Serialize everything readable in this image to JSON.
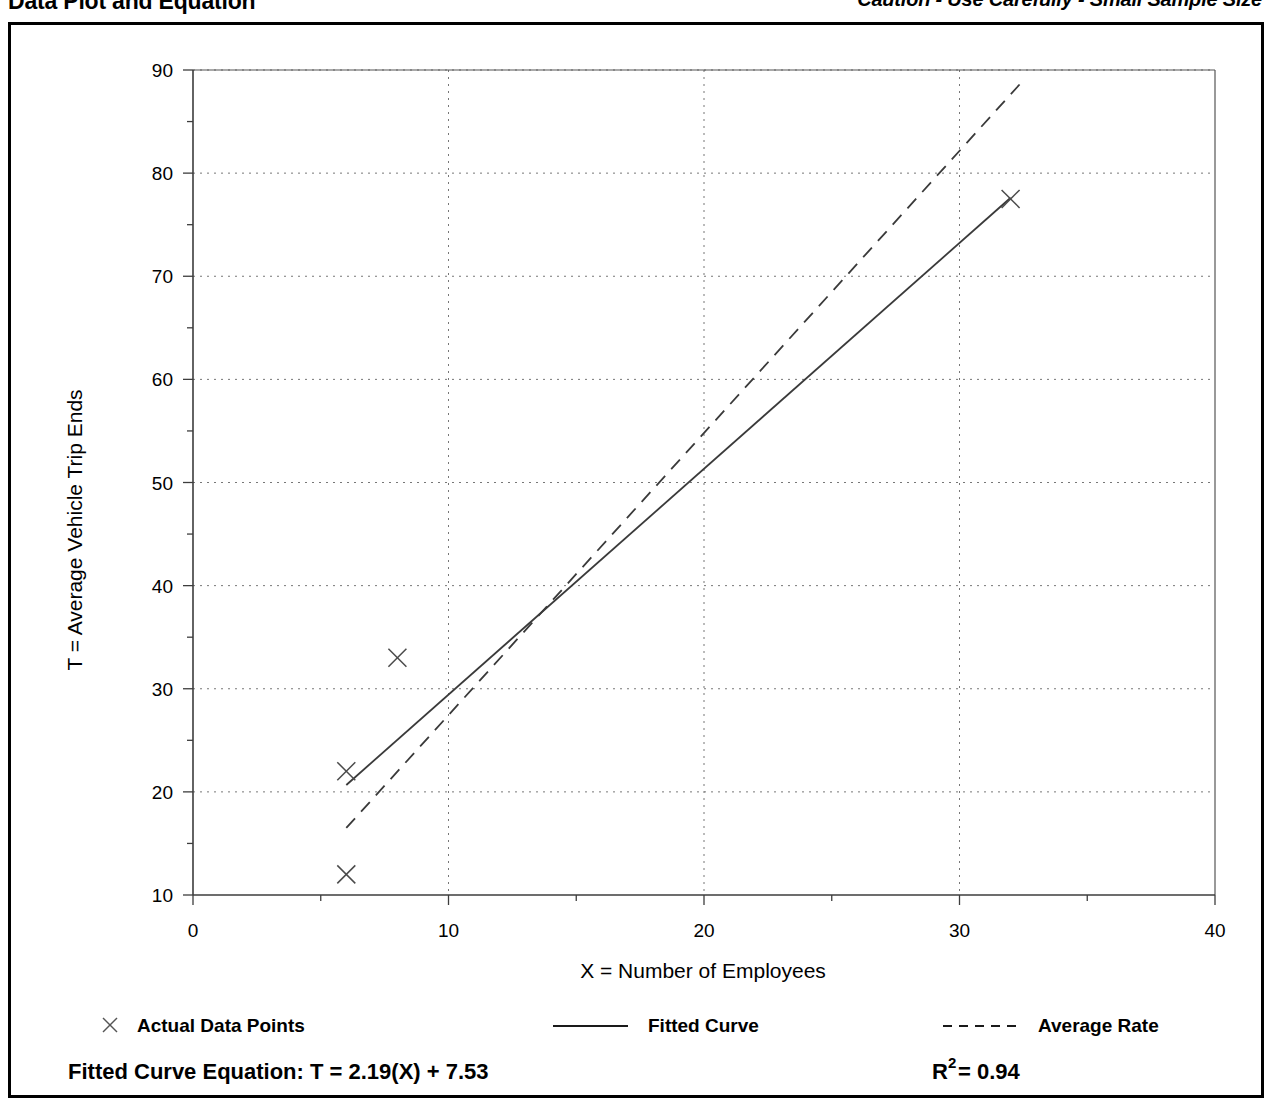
{
  "header": {
    "title": "Data Plot and Equation",
    "caution": "Caution - Use Carefully - Small Sample Size"
  },
  "chart_data": {
    "type": "scatter",
    "title": "Data Plot and Equation",
    "xlabel": "X = Number of Employees",
    "ylabel": "T = Average Vehicle Trip Ends",
    "xlim": [
      0,
      40
    ],
    "ylim": [
      10,
      90
    ],
    "xticks": [
      0,
      10,
      20,
      30,
      40
    ],
    "yticks": [
      10,
      20,
      30,
      40,
      50,
      60,
      70,
      80,
      90
    ],
    "xtick_labels": [
      "0",
      "10",
      "20",
      "30",
      "40"
    ],
    "ytick_labels": [
      "10",
      "20",
      "30",
      "40",
      "50",
      "60",
      "70",
      "80",
      "90"
    ],
    "minor_tick_step": 5,
    "grid": "dotted-major",
    "legend_position": "below-axes",
    "series": [
      {
        "name": "Actual Data Points",
        "type": "scatter",
        "marker": "x",
        "points": [
          {
            "x": 6,
            "y": 12
          },
          {
            "x": 6,
            "y": 22
          },
          {
            "x": 8,
            "y": 33
          },
          {
            "x": 32,
            "y": 77.5
          }
        ]
      },
      {
        "name": "Fitted Curve",
        "type": "line",
        "style": "solid",
        "equation": "T = 2.19(X) + 7.53",
        "slope": 2.19,
        "intercept": 7.53,
        "x_from": 6,
        "x_to": 32
      },
      {
        "name": "Average Rate",
        "type": "line",
        "style": "dashed",
        "x_from": 6,
        "x_to": 32.5,
        "y_from": 16.5,
        "y_to": 89.0
      }
    ]
  },
  "legend": {
    "items": [
      {
        "label": "Actual Data Points",
        "marker": "x"
      },
      {
        "label": "Fitted Curve",
        "marker": "solid-line"
      },
      {
        "label": "Average Rate",
        "marker": "dashed-line"
      }
    ]
  },
  "equation_row": {
    "fitted_label": "Fitted Curve Equation:  T = 2.19(X) + 7.53",
    "r2_base": "R",
    "r2_exp": "2",
    "r2_value": " = 0.94"
  },
  "colors": {
    "ink": "#000000",
    "axis": "#4d4d4d",
    "grid": "#777777",
    "background": "#ffffff"
  }
}
